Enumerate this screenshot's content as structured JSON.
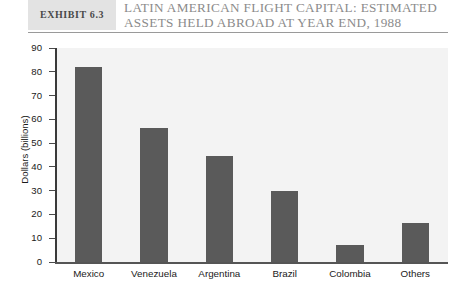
{
  "header": {
    "exhibit_label": "Exhibit 6.3",
    "title_line1": "Latin American Flight Capital: Estimated",
    "title_line2": "Assets Held Abroad at Year End, 1988"
  },
  "chart_data": {
    "type": "bar",
    "title": "Latin American Flight Capital: Estimated Assets Held Abroad at Year End, 1988",
    "categories": [
      "Mexico",
      "Venezuela",
      "Argentina",
      "Brazil",
      "Colombia",
      "Others"
    ],
    "values": [
      82,
      56.5,
      44.5,
      30,
      7,
      16.5
    ],
    "xlabel": "",
    "ylabel": "Dollars (billions)",
    "ylim": [
      0,
      90
    ],
    "ytick_step": 10,
    "yticks": [
      0,
      10,
      20,
      30,
      40,
      50,
      60,
      70,
      80,
      90
    ],
    "ytick_labels": [
      "0",
      "10",
      "20",
      "30",
      "40",
      "50",
      "60",
      "70",
      "80",
      "90"
    ],
    "grid": false,
    "legend": "none",
    "bar_color": "#5a5a5a",
    "plot_background": "#f3f3f3"
  }
}
